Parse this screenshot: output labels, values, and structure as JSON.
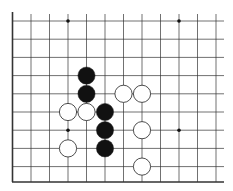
{
  "board": {
    "type": "go-diagram",
    "view": "lower-left corner",
    "columns": 12,
    "rows": 10,
    "colors": {
      "line": "#333333",
      "black_stone": "#111111",
      "white_stone": "#ffffff",
      "background": "#ffffff"
    },
    "star_points": [
      [
        3,
        0
      ],
      [
        9,
        0
      ],
      [
        3,
        6
      ],
      [
        9,
        6
      ]
    ],
    "stones": [
      {
        "color": "black",
        "col": 4,
        "row": 3
      },
      {
        "color": "black",
        "col": 4,
        "row": 4
      },
      {
        "color": "black",
        "col": 5,
        "row": 5
      },
      {
        "color": "black",
        "col": 5,
        "row": 6
      },
      {
        "color": "black",
        "col": 5,
        "row": 7
      },
      {
        "color": "white",
        "col": 6,
        "row": 4
      },
      {
        "color": "white",
        "col": 7,
        "row": 4
      },
      {
        "color": "white",
        "col": 3,
        "row": 5
      },
      {
        "color": "white",
        "col": 4,
        "row": 5
      },
      {
        "color": "white",
        "col": 7,
        "row": 6
      },
      {
        "color": "white",
        "col": 3,
        "row": 7
      },
      {
        "color": "white",
        "col": 7,
        "row": 8
      }
    ]
  }
}
